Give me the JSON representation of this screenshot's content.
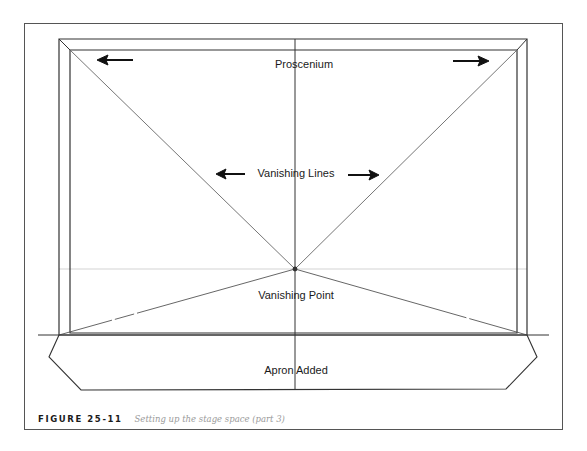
{
  "labels": {
    "proscenium": "Proscenium",
    "vanishing_lines": "Vanishing Lines",
    "vanishing_point": "Vanishing Point",
    "apron": "Apron Added"
  },
  "caption": {
    "number": "FIGURE 25-11",
    "text": "Setting up the stage space (part 3)"
  },
  "colors": {
    "line": "#333333",
    "light_line": "#bbbbbb",
    "caption_gray": "#9a9a9a"
  }
}
